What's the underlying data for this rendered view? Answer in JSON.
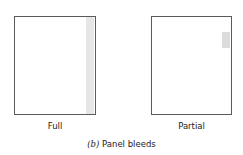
{
  "figure": {
    "caption_label": "(b)",
    "caption_text": "Panel bleeds",
    "panels": [
      {
        "label": "Full",
        "bleed": "full right edge"
      },
      {
        "label": "Partial",
        "bleed": "partial right edge"
      }
    ],
    "colors": {
      "border": "#5a5a5a",
      "bleed": "#e6e6e6"
    }
  }
}
